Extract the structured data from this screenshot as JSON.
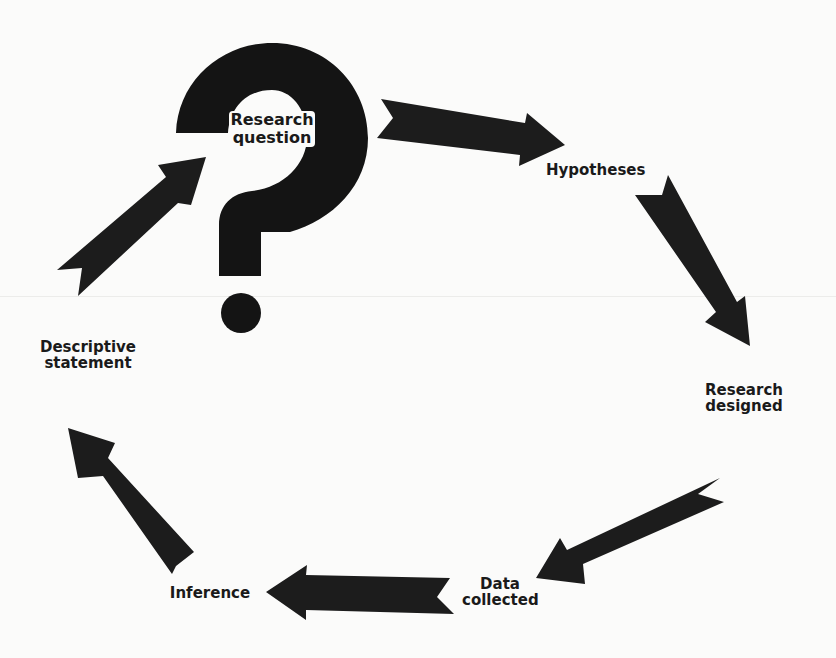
{
  "diagram": {
    "type": "cycle",
    "colors": {
      "background": "#fbfbfa",
      "ink": "#141414"
    },
    "nodes": [
      {
        "id": "research_question",
        "line1": "Research",
        "line2": "question"
      },
      {
        "id": "hypotheses",
        "line1": "Hypotheses",
        "line2": ""
      },
      {
        "id": "research_designed",
        "line1": "Research",
        "line2": "designed"
      },
      {
        "id": "data_collected",
        "line1": "Data",
        "line2": "collected"
      },
      {
        "id": "inference",
        "line1": "Inference",
        "line2": ""
      },
      {
        "id": "descriptive_statement",
        "line1": "Descriptive",
        "line2": "statement"
      }
    ],
    "edges": [
      {
        "from": "Research question",
        "to": "Hypotheses"
      },
      {
        "from": "Hypotheses",
        "to": "Research designed"
      },
      {
        "from": "Research designed",
        "to": "Data collected"
      },
      {
        "from": "Data collected",
        "to": "Inference"
      },
      {
        "from": "Inference",
        "to": "Descriptive statement"
      },
      {
        "from": "Descriptive statement",
        "to": "Research question"
      }
    ],
    "center_icon": "question-mark-icon"
  }
}
